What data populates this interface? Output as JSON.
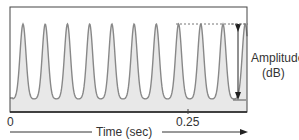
{
  "chart_data": {
    "type": "line",
    "title": "",
    "xlabel": "Time (sec)",
    "ylabel": "Amplitude (dB)",
    "x_ticks": [
      "0",
      "0.25"
    ],
    "waveform": {
      "peak_count": 10,
      "peak_x_px": [
        23,
        45,
        68,
        90,
        112,
        134,
        157,
        179,
        201,
        223
      ],
      "peak_y_px": 24,
      "trough_y_px": 99,
      "fill_color": "#e8e8e8",
      "line_color": "#888888"
    },
    "annotations": [
      "Amplitude (dB)"
    ]
  },
  "labels": {
    "x_origin": "0",
    "x_tick": "0.25",
    "x_axis": "Time (sec)",
    "amplitude_line1": "Amplitude",
    "amplitude_line2": "(dB)"
  }
}
